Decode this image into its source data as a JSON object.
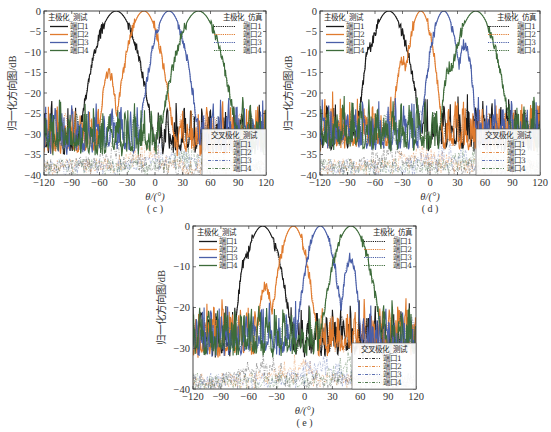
{
  "figure": {
    "xlabel": "θ/(°)",
    "ylabel": "归一化方向图/dB",
    "x_ticks": [
      -120,
      -90,
      -60,
      -30,
      0,
      30,
      60,
      90,
      120
    ],
    "legend_groups": {
      "co_measured": "主极化_测试",
      "co_simulated": "主极化_仿真",
      "cross_measured": "交叉极化_测试"
    },
    "port_labels": [
      "端口1",
      "端口2",
      "端口3",
      "端口4"
    ],
    "port_colors": [
      "#1a1a1a",
      "#e07b2e",
      "#4a5fa8",
      "#3d6b3a"
    ]
  },
  "chart_data": [
    {
      "panel": "c",
      "caption": "( c )",
      "type": "line",
      "xlabel": "θ/(°)",
      "ylabel": "归一化方向图/dB",
      "xlim": [
        -120,
        120
      ],
      "ylim": [
        -40,
        0
      ],
      "y_ticks": [
        0,
        -5,
        -10,
        -15,
        -20,
        -25,
        -30,
        -35,
        -40
      ],
      "legend": {
        "co_measured": {
          "title": "主极化_测试",
          "entries": [
            "端口1",
            "端口2",
            "端口3",
            "端口4"
          ],
          "position": "upper-left"
        },
        "co_simulated": {
          "title": "主极化_仿真",
          "entries": [
            "端口1",
            "端口2",
            "端口3",
            "端口4"
          ],
          "position": "upper-right"
        },
        "cross_measured": {
          "title": "交叉极化_测试",
          "entries": [
            "端口1",
            "端口2",
            "端口3",
            "端口4"
          ],
          "position": "lower-right"
        }
      },
      "series": [
        {
          "name": "端口1",
          "peak_deg": -42,
          "beamwidth_deg": 50,
          "sidelobe_db": -11,
          "sidelobe_deg": -15
        },
        {
          "name": "端口2",
          "peak_deg": -12,
          "beamwidth_deg": 40,
          "sidelobe_db": -15,
          "sidelobe_deg": -38
        },
        {
          "name": "端口3",
          "peak_deg": 15,
          "beamwidth_deg": 40,
          "sidelobe_db": -11,
          "sidelobe_deg": 17
        },
        {
          "name": "端口4",
          "peak_deg": 47,
          "beamwidth_deg": 52,
          "sidelobe_db": -11,
          "sidelobe_deg": 18
        }
      ],
      "floor_db": -28
    },
    {
      "panel": "d",
      "caption": "( d )",
      "type": "line",
      "xlabel": "θ/(°)",
      "ylabel": "归一化方向图/dB",
      "xlim": [
        -120,
        120
      ],
      "ylim": [
        -40,
        0
      ],
      "y_ticks": [
        0,
        -5,
        -10,
        -15,
        -20,
        -25,
        -30,
        -35,
        -40
      ],
      "legend": {
        "co_measured": {
          "title": "主极化_测试",
          "entries": [
            "端口1",
            "端口2",
            "端口3",
            "端口4"
          ],
          "position": "upper-left"
        },
        "co_simulated": {
          "title": "主极化_仿真",
          "entries": [
            "端口1",
            "端口2",
            "端口3",
            "端口4"
          ],
          "position": "upper-right"
        },
        "cross_measured": {
          "title": "交叉极化_测试",
          "entries": [
            "端口1",
            "端口2",
            "端口3",
            "端口4"
          ],
          "position": "lower-right"
        }
      },
      "series": [
        {
          "name": "端口1",
          "peak_deg": -45,
          "beamwidth_deg": 45,
          "sidelobe_db": -8.5,
          "sidelobe_deg": -20
        },
        {
          "name": "端口2",
          "peak_deg": -10,
          "beamwidth_deg": 30,
          "sidelobe_db": -12,
          "sidelobe_deg": -20
        },
        {
          "name": "端口3",
          "peak_deg": 15,
          "beamwidth_deg": 32,
          "sidelobe_db": -8,
          "sidelobe_deg": 23
        },
        {
          "name": "端口4",
          "peak_deg": 50,
          "beamwidth_deg": 48,
          "sidelobe_db": -13.5,
          "sidelobe_deg": -28
        }
      ],
      "floor_db": -27
    },
    {
      "panel": "e",
      "caption": "( e )",
      "type": "line",
      "xlabel": "θ/(°)",
      "ylabel": "归一化方向图/dB",
      "xlim": [
        -120,
        120
      ],
      "ylim": [
        -40,
        0
      ],
      "y_ticks": [
        0,
        -10,
        -20,
        -30,
        -40
      ],
      "legend": {
        "co_measured": {
          "title": "主极化_测试",
          "entries": [
            "端口1",
            "端口2",
            "端口3",
            "端口4"
          ],
          "position": "upper-left"
        },
        "co_simulated": {
          "title": "主极化_仿真",
          "entries": [
            "端口1",
            "端口2",
            "端口3",
            "端口4"
          ],
          "position": "upper-right"
        },
        "cross_measured": {
          "title": "交叉极化_测试",
          "entries": [
            "端口1",
            "端口2",
            "端口3",
            "端口4"
          ],
          "position": "lower-right"
        }
      },
      "series": [
        {
          "name": "端口1",
          "peak_deg": -45,
          "beamwidth_deg": 42,
          "sidelobe_db": -8,
          "sidelobe_deg": -18
        },
        {
          "name": "端口2",
          "peak_deg": -12,
          "beamwidth_deg": 34,
          "sidelobe_db": -15,
          "sidelobe_deg": -30
        },
        {
          "name": "端口3",
          "peak_deg": 17,
          "beamwidth_deg": 34,
          "sidelobe_db": -8,
          "sidelobe_deg": 32
        },
        {
          "name": "端口4",
          "peak_deg": 50,
          "beamwidth_deg": 44,
          "sidelobe_db": -16,
          "sidelobe_deg": -5
        }
      ],
      "floor_db": -25
    }
  ]
}
